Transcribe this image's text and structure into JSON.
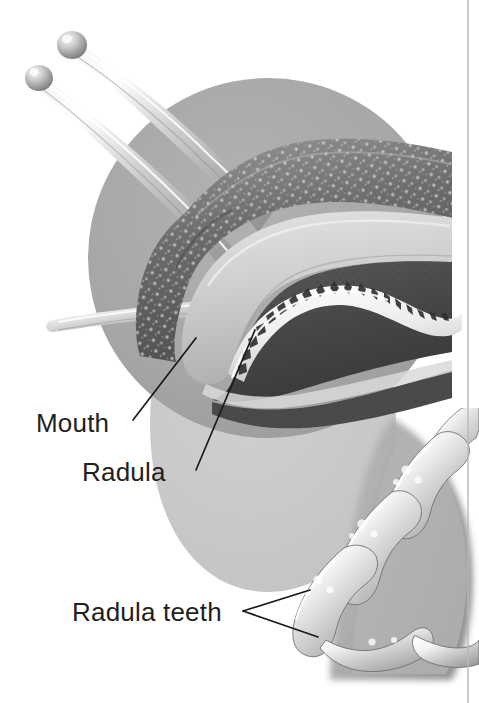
{
  "figure": {
    "background_color": "#ffffff",
    "label_color": "#231f20",
    "leader_color": "#1a1a1a",
    "rule_color": "#b9b9b9",
    "magnifier_circle_color": "#a8a8a8",
    "teardrop_color": "#c8c8c8",
    "labels": [
      {
        "id": "mouth",
        "text": "Mouth"
      },
      {
        "id": "radula",
        "text": "Radula"
      },
      {
        "id": "radula-teeth",
        "text": "Radula teeth"
      }
    ],
    "parts": {
      "eye_stalks": 2,
      "lower_tentacle": 1,
      "magnified_inset": "circular",
      "detail_inset": "radula-teeth-closeup"
    }
  }
}
